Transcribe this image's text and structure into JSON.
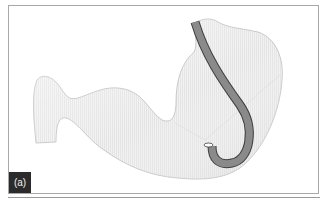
{
  "figure": {
    "panel_label": "(a)",
    "instrument": "endoscope in retroflexion",
    "colors": {
      "stomach_fill": "#efefef",
      "stomach_shade": "#e0e0e0",
      "stomach_outline": "#bdbdbd",
      "scope_fill": "#8a8a8a",
      "scope_outline": "#3e3e3e",
      "label_bg": "#2b2b2b",
      "label_text": "#f2f2f2",
      "frame": "#a8a8a8"
    }
  }
}
